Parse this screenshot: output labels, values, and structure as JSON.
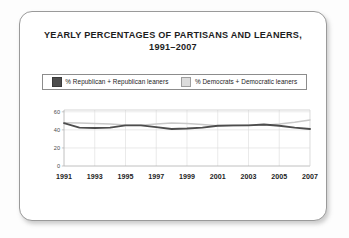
{
  "card": {
    "title_line1": "YEARLY PERCENTAGES OF PARTISANS AND LEANERS,",
    "title_line2": "1991–2007"
  },
  "legend": {
    "entries": [
      {
        "label": "% Republican + Republican leaners",
        "color": "#4d4d4d"
      },
      {
        "label": "% Democrats + Democratic leaners",
        "color": "#dcdcdc"
      }
    ]
  },
  "chart_data": {
    "type": "line",
    "title": "YEARLY PERCENTAGES OF PARTISANS AND LEANERS, 1991–2007",
    "xlabel": "",
    "ylabel": "",
    "x": [
      1991,
      1992,
      1993,
      1994,
      1995,
      1996,
      1997,
      1998,
      1999,
      2000,
      2001,
      2002,
      2003,
      2004,
      2005,
      2006,
      2007
    ],
    "xtick_labels": [
      "1991",
      "1993",
      "1995",
      "1997",
      "1999",
      "2001",
      "2003",
      "2005",
      "2007"
    ],
    "xticks": [
      1991,
      1993,
      1995,
      1997,
      1999,
      2001,
      2003,
      2005,
      2007
    ],
    "ytick_labels": [
      "0",
      "20",
      "40",
      "60"
    ],
    "yticks": [
      0,
      20,
      40,
      60
    ],
    "ylim": [
      0,
      62
    ],
    "xlim": [
      1991,
      2007
    ],
    "grid": true,
    "legend_position": "top",
    "series": [
      {
        "name": "% Republican + Republican leaners",
        "color": "#4d4d4d",
        "values": [
          47.5,
          42.5,
          42.0,
          42.5,
          45.0,
          45.0,
          43.0,
          41.0,
          41.5,
          42.5,
          44.5,
          45.0,
          45.0,
          46.0,
          44.5,
          42.5,
          41.0
        ]
      },
      {
        "name": "% Democrats + Democratic leaners",
        "color": "#c9c9c9",
        "values": [
          48.0,
          47.5,
          47.0,
          46.5,
          45.5,
          45.0,
          46.5,
          47.5,
          47.0,
          46.0,
          44.5,
          44.5,
          45.0,
          45.0,
          46.5,
          48.5,
          51.0
        ]
      }
    ]
  }
}
